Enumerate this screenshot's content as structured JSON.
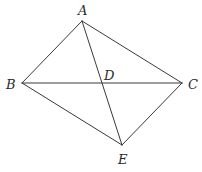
{
  "diagram": {
    "type": "geometry",
    "points": {
      "A": {
        "label": "A",
        "x": 82,
        "y": 21,
        "label_x": 78,
        "label_y": 15
      },
      "B": {
        "label": "B",
        "x": 22,
        "y": 83,
        "label_x": 6,
        "label_y": 89
      },
      "C": {
        "label": "C",
        "x": 182,
        "y": 83,
        "label_x": 188,
        "label_y": 89
      },
      "D": {
        "label": "D",
        "x": 103,
        "y": 83,
        "label_x": 104,
        "label_y": 80
      },
      "E": {
        "label": "E",
        "x": 122,
        "y": 145,
        "label_x": 118,
        "label_y": 164
      }
    },
    "segments": [
      {
        "name": "AB",
        "from": "A",
        "to": "B"
      },
      {
        "name": "AC",
        "from": "A",
        "to": "C"
      },
      {
        "name": "BE",
        "from": "B",
        "to": "E"
      },
      {
        "name": "CE",
        "from": "C",
        "to": "E"
      },
      {
        "name": "BC",
        "from": "B",
        "to": "C"
      },
      {
        "name": "AE",
        "from": "A",
        "to": "E"
      }
    ],
    "colors": {
      "stroke": "#3a3a3a",
      "label": "#2a2a2a",
      "background": "#ffffff"
    }
  }
}
